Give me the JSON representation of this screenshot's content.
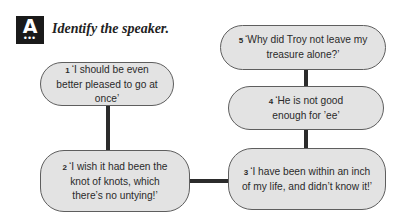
{
  "header": {
    "badge_letter": "A",
    "badge_dots": "•••",
    "title": "Identify the speaker."
  },
  "bubbles": [
    {
      "num": "1",
      "text": "‘I should be even better pleased to go at once’"
    },
    {
      "num": "2",
      "text": "‘I wish it had been the knot of knots, which there’s no untying!’"
    },
    {
      "num": "3",
      "text": "‘I have been within an inch of my life, and didn’t know it!’"
    },
    {
      "num": "4",
      "text": "‘He is not good enough for ’ee’"
    },
    {
      "num": "5",
      "text": "‘Why did Troy not leave my treasure alone?’"
    }
  ],
  "colors": {
    "bubble_fill": "#e3e3e3",
    "bubble_border": "#5e5e5e",
    "connector": "#2b2b2b",
    "badge": "#1a1a1a"
  }
}
